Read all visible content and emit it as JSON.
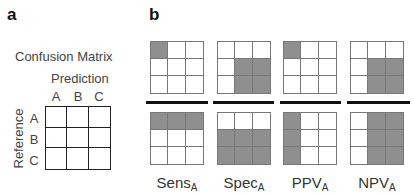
{
  "panel_a": {
    "label": "a",
    "title": "Confusion Matrix",
    "column_axis_label": "Prediction",
    "row_axis_label": "Reference",
    "columns": [
      "A",
      "B",
      "C"
    ],
    "rows": [
      "A",
      "B",
      "C"
    ]
  },
  "panel_b": {
    "label": "b",
    "shade_color": "#8f8f8f",
    "metrics": [
      {
        "name": "Sens",
        "subscript": "A",
        "numerator_cells": [
          1,
          0,
          0,
          0,
          0,
          0,
          0,
          0,
          0
        ],
        "denominator_cells": [
          1,
          1,
          1,
          0,
          0,
          0,
          0,
          0,
          0
        ]
      },
      {
        "name": "Spec",
        "subscript": "A",
        "numerator_cells": [
          0,
          0,
          0,
          0,
          1,
          1,
          0,
          1,
          1
        ],
        "denominator_cells": [
          0,
          0,
          0,
          1,
          1,
          1,
          1,
          1,
          1
        ]
      },
      {
        "name": "PPV",
        "subscript": "A",
        "numerator_cells": [
          1,
          0,
          0,
          0,
          0,
          0,
          0,
          0,
          0
        ],
        "denominator_cells": [
          1,
          0,
          0,
          1,
          0,
          0,
          1,
          0,
          0
        ]
      },
      {
        "name": "NPV",
        "subscript": "A",
        "numerator_cells": [
          0,
          0,
          0,
          0,
          1,
          1,
          0,
          1,
          1
        ],
        "denominator_cells": [
          0,
          1,
          1,
          0,
          1,
          1,
          0,
          1,
          1
        ]
      }
    ]
  }
}
